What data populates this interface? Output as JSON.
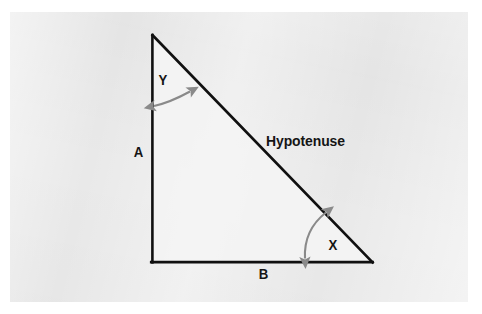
{
  "figure": {
    "kind": "right-triangle-geometry-diagram",
    "panel_background_color": "#e9e9e9",
    "page_background_color": "#ffffff",
    "stroke_color": "#101010",
    "angle_arrow_color": "#8a8a8a",
    "label_color": "#151515"
  },
  "labels": {
    "side_a": "A",
    "side_b": "B",
    "hypotenuse": "Hypotenuse",
    "angle_x": "X",
    "angle_y": "Y"
  },
  "geometry": {
    "apex": {
      "x": 152,
      "y": 35
    },
    "right_angle_corner": {
      "x": 152,
      "y": 262
    },
    "base_right": {
      "x": 372,
      "y": 262
    },
    "vertical_leg_name": "A",
    "horizontal_leg_name": "B",
    "slanted_side_name": "Hypotenuse",
    "angle_at_apex_name": "Y",
    "angle_at_base_right_name": "X",
    "right_angle_location": "bottom-left"
  },
  "annotations": {
    "angle_arc_y": {
      "start": {
        "x": 153,
        "y": 106
      },
      "end": {
        "x": 191,
        "y": 91
      },
      "double_headed": true
    },
    "angle_arc_x": {
      "start": {
        "x": 304,
        "y": 259
      },
      "end": {
        "x": 327,
        "y": 212
      },
      "double_headed": true
    }
  }
}
